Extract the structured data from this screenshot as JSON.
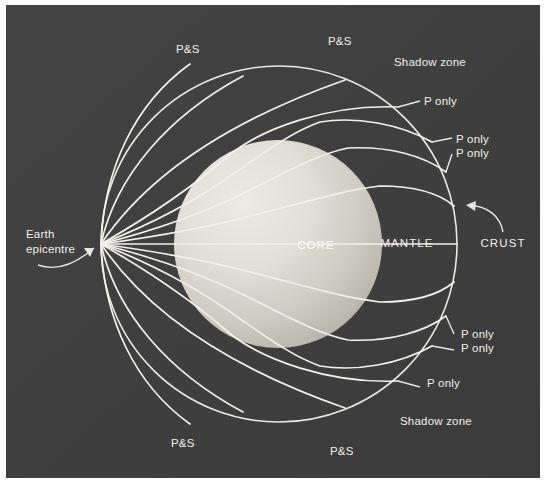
{
  "figure": {
    "background_color": "#ffffff",
    "panel_color": "#3f3f3f",
    "line_color": "#f2f1ec",
    "core_color_light": "#e6e4dc",
    "core_color_dark": "#b4b1a6"
  },
  "panel": {
    "x": 6,
    "y": 5,
    "width": 534,
    "height": 473
  },
  "geometry": {
    "earth_center_x": 279,
    "earth_center_y": 244,
    "earth_radius": 178,
    "core_center_x": 278,
    "core_center_y": 244,
    "core_radius": 104,
    "epicentre_x": 101,
    "epicentre_y": 244
  },
  "labels": {
    "epicentre": {
      "line1": "Earth",
      "line2": "epicentre",
      "x": 26,
      "y": 238
    },
    "core": {
      "text": "CORE",
      "x": 316,
      "y": 245
    },
    "mantle": {
      "text": "MANTLE",
      "x": 407,
      "y": 243
    },
    "crust": {
      "text": "CRUST",
      "x": 481,
      "y": 243
    },
    "ps_top_left": {
      "text": "P&S",
      "x": 176,
      "y": 49
    },
    "ps_top_right": {
      "text": "P&S",
      "x": 328,
      "y": 41
    },
    "ps_bottom_left": {
      "text": "P&S",
      "x": 171,
      "y": 443
    },
    "ps_bottom_right": {
      "text": "P&S",
      "x": 330,
      "y": 451
    },
    "shadow_zone_top": {
      "text": "Shadow zone",
      "x": 394,
      "y": 62
    },
    "p_only_top_1": {
      "text": "P only",
      "x": 424,
      "y": 101
    },
    "p_only_top_2": {
      "text": "P only",
      "x": 438,
      "y": 139
    },
    "p_only_top_3": {
      "text": "P only",
      "x": 438,
      "y": 153
    },
    "p_only_bottom_1": {
      "text": "P only",
      "x": 461,
      "y": 334
    },
    "p_only_bottom_2": {
      "text": "P only",
      "x": 461,
      "y": 348
    },
    "p_only_bottom_3": {
      "text": "P only",
      "x": 427,
      "y": 383
    },
    "shadow_zone_bottom": {
      "text": "Shadow zone",
      "x": 400,
      "y": 421
    }
  },
  "legend_terms": [
    "P&S",
    "P only",
    "Shadow zone",
    "CORE",
    "MANTLE",
    "CRUST",
    "Earth epicentre"
  ]
}
